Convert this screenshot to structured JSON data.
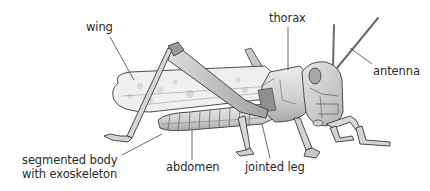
{
  "diagram": {
    "labels": {
      "wing": "wing",
      "thorax": "thorax",
      "antenna": "antenna",
      "segmented_body_line1": "segmented body",
      "segmented_body_line2": "with exoskeleton",
      "abdomen": "abdomen",
      "jointed_leg": "jointed leg"
    },
    "colors": {
      "background": "#ffffff",
      "outline": "#3a3a3a",
      "body_light": "#e4e4e4",
      "body_mid": "#c4c4c4",
      "body_dark": "#9a9a9a",
      "wing_fill": "#eeeeee",
      "leader_line": "#444444",
      "text": "#2a2a2a"
    }
  }
}
